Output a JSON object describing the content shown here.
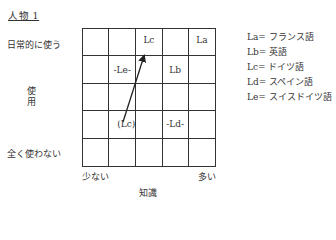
{
  "title": "人物 1",
  "y_axis": {
    "label": "使用",
    "label_chars": [
      "使",
      "用"
    ],
    "top": "日常的に使う",
    "bottom": "全く使わない"
  },
  "x_axis": {
    "label": "知識",
    "left": "少ない",
    "right": "多い"
  },
  "grid": {
    "rows": 5,
    "cols": 5,
    "cells": [
      [
        "",
        "",
        "Lc",
        "",
        "La"
      ],
      [
        "",
        "-Le-",
        "",
        "Lb",
        ""
      ],
      [
        "",
        "",
        "",
        "",
        ""
      ],
      [
        "",
        "(Lc)",
        "",
        "-Ld-",
        ""
      ],
      [
        "",
        "",
        "",
        "",
        ""
      ]
    ]
  },
  "arrow": {
    "from": "(Lc)",
    "to": "Lc",
    "from_cell": [
      3,
      1
    ],
    "to_cell": [
      0,
      2
    ]
  },
  "legend": [
    "La= フランス語",
    "Lb= 英語",
    "Lc= ドイツ語",
    "Ld= スペイン語",
    "Le= スイスドイツ語"
  ]
}
